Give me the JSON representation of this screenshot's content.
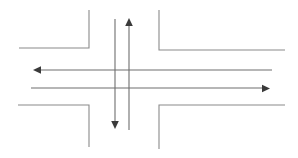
{
  "diagram": {
    "caption": "",
    "canvas": {
      "width": 298,
      "height": 158
    },
    "colors": {
      "background": "#ffffff",
      "road_edge": "#8a8a8a",
      "flow_line": "#6e6e6e",
      "arrow_head": "#3a3a3a"
    },
    "road_edges": [
      {
        "name": "northwest-corner",
        "label": "North-west road corner",
        "path": "M 89 10 L 89 48 L 19 48"
      },
      {
        "name": "northeast-corner",
        "label": "North-east road corner",
        "path": "M 159 10 L 159 50 L 285 50"
      },
      {
        "name": "southwest-corner",
        "label": "South-west road corner",
        "path": "M 18 105 L 89 105 L 89 147"
      },
      {
        "name": "southeast-corner",
        "label": "South-east road corner",
        "path": "M 285 105 L 159 105 L 159 149"
      }
    ],
    "flow_arrows": [
      {
        "name": "northbound-arrow",
        "label": "Northbound traffic flow",
        "direction": "up",
        "shaft": {
          "x1": 129,
          "y1": 130,
          "x2": 129,
          "y2": 24
        },
        "head": "129,18 125.2,26 132.8,26"
      },
      {
        "name": "southbound-arrow",
        "label": "Southbound traffic flow",
        "direction": "down",
        "shaft": {
          "x1": 115,
          "y1": 19,
          "x2": 115,
          "y2": 122
        },
        "head": "115,129 111.2,121 118.8,121"
      },
      {
        "name": "westbound-arrow",
        "label": "Westbound traffic flow",
        "direction": "left",
        "shaft": {
          "x1": 272,
          "y1": 70,
          "x2": 40,
          "y2": 70
        },
        "head": "33,70 41,66.2 41,73.8"
      },
      {
        "name": "eastbound-arrow",
        "label": "Eastbound traffic flow",
        "direction": "right",
        "shaft": {
          "x1": 31,
          "y1": 88,
          "x2": 263,
          "y2": 88
        },
        "head": "270,88.5 262,84.7 262,92.3"
      }
    ]
  }
}
